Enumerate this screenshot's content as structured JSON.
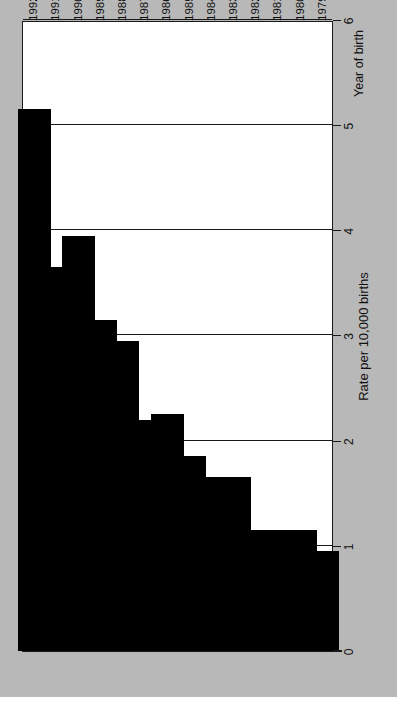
{
  "chart_data": {
    "type": "bar",
    "orientation": "horizontal",
    "title": "",
    "xlabel": "Rate per 10,000 births",
    "ylabel": "Year of birth",
    "categories": [
      "1979",
      "1980",
      "1981",
      "1982",
      "1983",
      "1984",
      "1985",
      "1986",
      "1987",
      "1988",
      "1989",
      "1990",
      "1991",
      "1992"
    ],
    "values": [
      0.95,
      1.15,
      1.15,
      1.15,
      1.65,
      1.65,
      1.85,
      2.25,
      2.2,
      2.95,
      3.15,
      3.95,
      3.65,
      5.15
    ],
    "xlim": [
      0,
      6
    ],
    "xticks": [
      0,
      1,
      2,
      3,
      4,
      5,
      6
    ],
    "xticklabels": [
      "0",
      "1",
      "2",
      "3",
      "4",
      "5",
      "6"
    ],
    "grid": true,
    "grid_axis": "x",
    "legend": null,
    "bar_color": "#000000",
    "plot_background": "#ffffff",
    "page_background": "#b8b8b8",
    "axis_color": "#1a1a1a"
  },
  "axes": {
    "value_axis_title": "Rate per 10,000 births",
    "category_axis_title": "Year of birth"
  }
}
